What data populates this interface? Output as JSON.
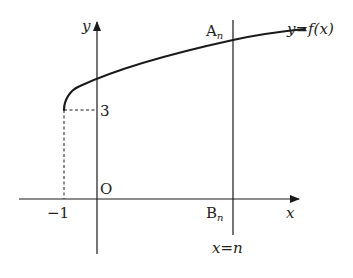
{
  "diagram": {
    "type": "function-graph",
    "function_label": "y=f(x)",
    "axes": {
      "x_label": "x",
      "y_label": "y",
      "origin_label": "O"
    },
    "points": {
      "start": {
        "x": -1,
        "y": 3,
        "x_tick": "−1",
        "y_tick": "3"
      },
      "A": {
        "name": "A",
        "sub": "n"
      },
      "B": {
        "name": "B",
        "sub": "n"
      }
    },
    "vertical_line_label": "x=n",
    "colors": {
      "stroke": "#1a1a1a",
      "text": "#222222"
    }
  }
}
